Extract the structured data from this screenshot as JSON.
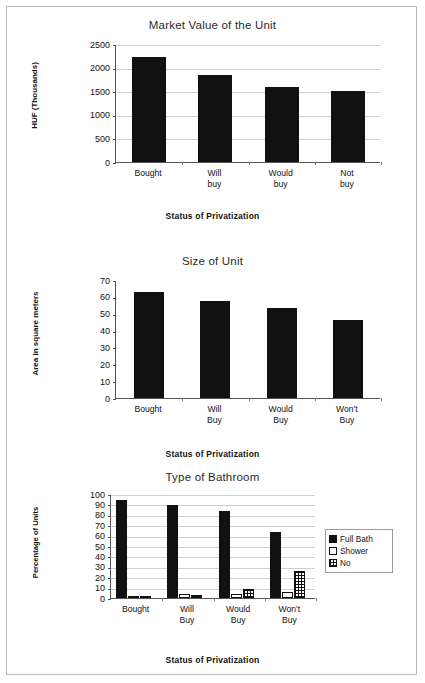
{
  "document": {
    "background_color": "#ffffff",
    "border_color": "#b9b9b9",
    "bar_color": "#111111"
  },
  "chart_data": [
    {
      "type": "bar",
      "title": "Market Value of the Unit",
      "xlabel": "Status of Privatization",
      "ylabel": "HUF (Thousands)",
      "categories": [
        "Bought",
        "Will\nbuy",
        "Would\nbuy",
        "Not\nbuy"
      ],
      "values": [
        2230,
        1850,
        1590,
        1500
      ],
      "ylim": [
        0,
        2500
      ],
      "yticks": [
        0,
        500,
        1000,
        1500,
        2000,
        2500
      ],
      "grid": true,
      "legend": null
    },
    {
      "type": "bar",
      "title": "Size of Unit",
      "xlabel": "Status of Privatization",
      "ylabel": "Area in square meters",
      "categories": [
        "Bought",
        "Will\nBuy",
        "Would\nBuy",
        "Won't\nBuy"
      ],
      "values": [
        63,
        57.5,
        53.5,
        46.5
      ],
      "ylim": [
        0,
        70
      ],
      "yticks": [
        0,
        10,
        20,
        30,
        40,
        50,
        60,
        70
      ],
      "grid": false,
      "legend": null
    },
    {
      "type": "bar",
      "title": "Type of Bathroom",
      "xlabel": "Status of Privatization",
      "ylabel": "Percentage of Units",
      "categories": [
        "Bought",
        "Will\nBuy",
        "Would\nBuy",
        "Won't\nBuy"
      ],
      "series": [
        {
          "name": "Full Bath",
          "fill": "solid",
          "values": [
            94,
            89.5,
            84,
            63
          ]
        },
        {
          "name": "Shower",
          "fill": "open",
          "values": [
            2,
            4,
            4,
            6
          ]
        },
        {
          "name": "No",
          "fill": "hatch",
          "values": [
            2,
            2.5,
            8.5,
            25.5
          ]
        }
      ],
      "ylim": [
        0,
        100
      ],
      "yticks": [
        0,
        10,
        20,
        30,
        40,
        50,
        60,
        70,
        80,
        90,
        100
      ],
      "grid": true,
      "legend": {
        "position": "right",
        "entries": [
          "Full Bath",
          "Shower",
          "No"
        ]
      }
    }
  ]
}
